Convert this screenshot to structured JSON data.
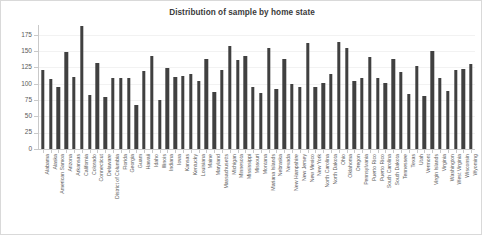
{
  "chart_data": {
    "type": "bar",
    "title": "Distribution of sample by home state",
    "xlabel": "",
    "ylabel": "",
    "ylim": [
      0,
      190
    ],
    "yticks": [
      0,
      25,
      50,
      75,
      100,
      125,
      150,
      175
    ],
    "ytick_labels": [
      "0",
      "25",
      "50",
      "75",
      "100",
      "125",
      "150",
      "175"
    ],
    "grid": true,
    "legend": null,
    "bar_color": "#404040",
    "categories": [
      "Alabama",
      "Alaska",
      "American Samoa",
      "Arizona",
      "Arkansas",
      "California",
      "Colorado",
      "Connecticut",
      "Delaware",
      "District of Columbia",
      "Florida",
      "Georgia",
      "Guam",
      "Hawaii",
      "Idaho",
      "Illinois",
      "Indiana",
      "Iowa",
      "Kansas",
      "Kentucky",
      "Louisiana",
      "Maine",
      "Maryland",
      "Massachusetts",
      "Michigan",
      "Minnesota",
      "Mississippi",
      "Missouri",
      "Montana",
      "Mariana Islands",
      "Nebraska",
      "Nevada",
      "New Hampshire",
      "New Jersey",
      "New Mexico",
      "New York",
      "North Carolina",
      "North Dakota",
      "Ohio",
      "Oklahoma",
      "Oregon",
      "Pennsylvania",
      "Puerto Rico",
      "Puerto Rico",
      "South Carolina",
      "South Dakota",
      "Tennessee",
      "Texas",
      "Utah",
      "Vermont",
      "Virgin Islands",
      "Virginia",
      "Washington",
      "West Virginia",
      "Wisconsin",
      "Wyoming"
    ],
    "values": [
      123,
      109,
      96,
      150,
      112,
      190,
      85,
      133,
      81,
      110,
      110,
      110,
      69,
      121,
      144,
      76,
      125,
      112,
      114,
      117,
      106,
      139,
      89,
      122,
      159,
      138,
      144,
      97,
      87,
      156,
      93,
      140,
      101,
      96,
      164,
      96,
      103,
      116,
      166,
      157,
      105,
      110,
      142,
      110,
      102,
      140,
      119,
      86,
      128,
      83,
      151,
      110,
      90,
      122,
      124,
      132
    ]
  }
}
